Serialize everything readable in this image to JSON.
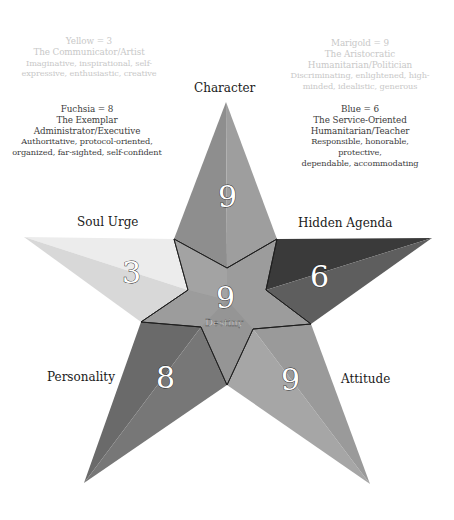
{
  "descriptions": [
    {
      "id": "yellow",
      "head": "Yellow = 3",
      "title": "The Communicator/Artist",
      "traits": [
        "Imaginative, inspirational, self-",
        "expressive, enthusiastic, creative"
      ],
      "style": "faded"
    },
    {
      "id": "fuchsia",
      "head": "Fuchsia = 8",
      "title": "The Exemplar",
      "title2": "Administrator/Executive",
      "traits": [
        "Authoritative, protocol-oriented,",
        "organized, far-sighted, self-confident"
      ],
      "style": "dark"
    },
    {
      "id": "marigold",
      "head": "Marigold = 9",
      "title": "The Aristocratic",
      "title2": "Humanitarian/Politician",
      "traits": [
        "Discriminating, enlightened, high-",
        "minded, idealistic, generous"
      ],
      "style": "faded"
    },
    {
      "id": "blue",
      "head": "Blue = 6",
      "title": "The Service-Oriented",
      "title2": "Humanitarian/Teacher",
      "traits": [
        "Responsible, honorable, protective,",
        "dependable, accommodating"
      ],
      "style": "dark"
    }
  ],
  "star": {
    "points": [
      {
        "id": "character",
        "label": "Character",
        "number": "9"
      },
      {
        "id": "soul-urge",
        "label": "Soul Urge",
        "number": "3"
      },
      {
        "id": "hidden-agenda",
        "label": "Hidden Agenda",
        "number": "6"
      },
      {
        "id": "personality",
        "label": "Personality",
        "number": "8"
      },
      {
        "id": "attitude",
        "label": "Attitude",
        "number": "9"
      }
    ],
    "center": {
      "label": "Destiny",
      "number": "9"
    },
    "colors": {
      "character_left": "#8e8e8e",
      "character_right": "#9c9c9c",
      "soul_top": "#ececec",
      "soul_bottom": "#dadada",
      "hidden_top": "#3a3a3a",
      "hidden_bottom": "#5c5c5c",
      "personality_left": "#6a6a6a",
      "personality_right": "#767676",
      "attitude_left": "#9a9a9a",
      "attitude_right": "#a8a8a8",
      "center": "#9a9a9a",
      "center_light": "#a4a4a4"
    }
  }
}
